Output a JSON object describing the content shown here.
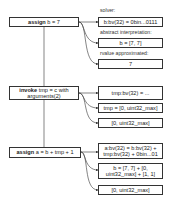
{
  "steps": [
    {
      "keyword": "assign",
      "rest": " b = 7",
      "results": {
        "solver_label": "solver:",
        "solver": "b:bv(32) = 0bin...0111",
        "ai_label": "abstract interpretation:",
        "ai": "b = [7, 7]",
        "rvalue_label": "rvalue approximated:",
        "rvalue": "7"
      }
    },
    {
      "keyword": "invoke",
      "rest": " tmp = c with arguments(2)",
      "results": {
        "solver": "tmp:bv(32) = ...",
        "ai": "tmp = [0, uint32_max]",
        "rvalue": "[0, uint32_max]"
      }
    },
    {
      "keyword": "assign",
      "rest": " a = b + tmp + 1",
      "results": {
        "solver": "a:bv(32) = b:bv(32) + tmp:bv(32) + 0bin...01",
        "ai": "b = [7, 7] + [0, uint32_max] + [1, 1]",
        "rvalue": "[0, uint32_max]"
      }
    }
  ],
  "colors": {
    "stroke": "#333333",
    "background": "#ffffff"
  }
}
